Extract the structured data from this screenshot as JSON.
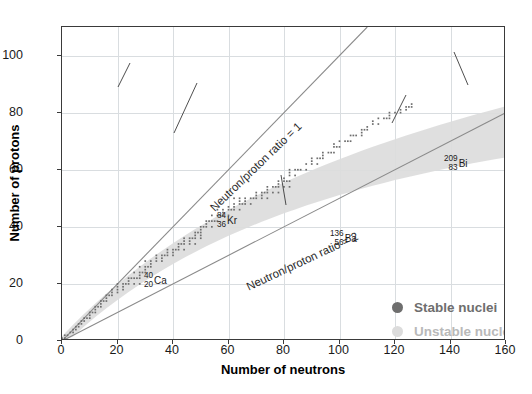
{
  "chart_data": {
    "type": "scatter",
    "title": "",
    "xlabel": "Number of neutrons",
    "ylabel": "Number of protons",
    "xlim": [
      0,
      160
    ],
    "ylim": [
      0,
      110
    ],
    "xticks": [
      0,
      20,
      40,
      60,
      80,
      100,
      120,
      140,
      160
    ],
    "yticks": [
      0,
      20,
      40,
      60,
      80,
      100
    ],
    "grid": true,
    "legend_position": "lower-right-inside",
    "series": [
      {
        "name": "Stable nuclei",
        "color": "#6e6e6e",
        "marker": "dot",
        "description": "Band of stable isotopes curving above the N/Z=1 line",
        "points": [
          [
            0,
            1
          ],
          [
            1,
            1
          ],
          [
            1,
            2
          ],
          [
            2,
            2
          ],
          [
            3,
            3
          ],
          [
            4,
            3
          ],
          [
            4,
            4
          ],
          [
            5,
            4
          ],
          [
            5,
            5
          ],
          [
            6,
            5
          ],
          [
            6,
            6
          ],
          [
            7,
            6
          ],
          [
            7,
            7
          ],
          [
            8,
            7
          ],
          [
            8,
            8
          ],
          [
            9,
            8
          ],
          [
            10,
            8
          ],
          [
            10,
            9
          ],
          [
            10,
            10
          ],
          [
            11,
            10
          ],
          [
            12,
            10
          ],
          [
            12,
            11
          ],
          [
            12,
            12
          ],
          [
            13,
            12
          ],
          [
            14,
            12
          ],
          [
            14,
            13
          ],
          [
            14,
            14
          ],
          [
            15,
            14
          ],
          [
            16,
            14
          ],
          [
            16,
            15
          ],
          [
            16,
            16
          ],
          [
            17,
            16
          ],
          [
            18,
            16
          ],
          [
            18,
            17
          ],
          [
            20,
            17
          ],
          [
            18,
            18
          ],
          [
            20,
            18
          ],
          [
            22,
            18
          ],
          [
            20,
            19
          ],
          [
            22,
            19
          ],
          [
            20,
            20
          ],
          [
            22,
            20
          ],
          [
            23,
            20
          ],
          [
            24,
            20
          ],
          [
            26,
            20
          ],
          [
            28,
            20
          ],
          [
            24,
            21
          ],
          [
            24,
            22
          ],
          [
            25,
            22
          ],
          [
            26,
            22
          ],
          [
            27,
            22
          ],
          [
            28,
            22
          ],
          [
            28,
            23
          ],
          [
            26,
            24
          ],
          [
            28,
            24
          ],
          [
            29,
            24
          ],
          [
            30,
            24
          ],
          [
            30,
            25
          ],
          [
            28,
            26
          ],
          [
            30,
            26
          ],
          [
            31,
            26
          ],
          [
            32,
            26
          ],
          [
            32,
            27
          ],
          [
            30,
            28
          ],
          [
            32,
            28
          ],
          [
            34,
            28
          ],
          [
            36,
            28
          ],
          [
            34,
            29
          ],
          [
            36,
            29
          ],
          [
            34,
            30
          ],
          [
            36,
            30
          ],
          [
            37,
            30
          ],
          [
            38,
            30
          ],
          [
            40,
            30
          ],
          [
            38,
            31
          ],
          [
            40,
            31
          ],
          [
            38,
            32
          ],
          [
            40,
            32
          ],
          [
            41,
            32
          ],
          [
            42,
            32
          ],
          [
            44,
            32
          ],
          [
            42,
            33
          ],
          [
            42,
            34
          ],
          [
            43,
            34
          ],
          [
            44,
            34
          ],
          [
            46,
            34
          ],
          [
            48,
            34
          ],
          [
            44,
            35
          ],
          [
            46,
            35
          ],
          [
            44,
            36
          ],
          [
            46,
            36
          ],
          [
            47,
            36
          ],
          [
            48,
            36
          ],
          [
            50,
            36
          ],
          [
            48,
            37
          ],
          [
            50,
            37
          ],
          [
            48,
            38
          ],
          [
            49,
            38
          ],
          [
            50,
            38
          ],
          [
            50,
            39
          ],
          [
            50,
            40
          ],
          [
            51,
            40
          ],
          [
            52,
            40
          ],
          [
            54,
            40
          ],
          [
            52,
            41
          ],
          [
            52,
            42
          ],
          [
            53,
            42
          ],
          [
            54,
            42
          ],
          [
            55,
            42
          ],
          [
            56,
            42
          ],
          [
            54,
            44
          ],
          [
            56,
            44
          ],
          [
            57,
            44
          ],
          [
            58,
            44
          ],
          [
            60,
            44
          ],
          [
            58,
            45
          ],
          [
            56,
            46
          ],
          [
            58,
            46
          ],
          [
            60,
            46
          ],
          [
            61,
            46
          ],
          [
            62,
            46
          ],
          [
            64,
            46
          ],
          [
            60,
            47
          ],
          [
            62,
            47
          ],
          [
            62,
            48
          ],
          [
            64,
            48
          ],
          [
            65,
            48
          ],
          [
            66,
            48
          ],
          [
            68,
            48
          ],
          [
            64,
            49
          ],
          [
            66,
            49
          ],
          [
            62,
            50
          ],
          [
            64,
            50
          ],
          [
            66,
            50
          ],
          [
            68,
            50
          ],
          [
            69,
            50
          ],
          [
            70,
            50
          ],
          [
            72,
            50
          ],
          [
            74,
            50
          ],
          [
            70,
            51
          ],
          [
            72,
            51
          ],
          [
            70,
            52
          ],
          [
            72,
            52
          ],
          [
            73,
            52
          ],
          [
            74,
            52
          ],
          [
            76,
            52
          ],
          [
            78,
            52
          ],
          [
            74,
            53
          ],
          [
            74,
            54
          ],
          [
            76,
            54
          ],
          [
            77,
            54
          ],
          [
            78,
            54
          ],
          [
            80,
            54
          ],
          [
            82,
            54
          ],
          [
            78,
            55
          ],
          [
            78,
            56
          ],
          [
            80,
            56
          ],
          [
            81,
            56
          ],
          [
            82,
            56
          ],
          [
            80,
            57
          ],
          [
            82,
            58
          ],
          [
            84,
            58
          ],
          [
            82,
            59
          ],
          [
            82,
            60
          ],
          [
            84,
            60
          ],
          [
            85,
            60
          ],
          [
            86,
            60
          ],
          [
            88,
            60
          ],
          [
            88,
            62
          ],
          [
            90,
            62
          ],
          [
            92,
            62
          ],
          [
            90,
            63
          ],
          [
            90,
            64
          ],
          [
            92,
            64
          ],
          [
            93,
            64
          ],
          [
            94,
            64
          ],
          [
            94,
            65
          ],
          [
            94,
            66
          ],
          [
            96,
            66
          ],
          [
            97,
            66
          ],
          [
            98,
            66
          ],
          [
            98,
            68
          ],
          [
            99,
            68
          ],
          [
            100,
            68
          ],
          [
            98,
            69
          ],
          [
            100,
            70
          ],
          [
            102,
            70
          ],
          [
            103,
            70
          ],
          [
            104,
            70
          ],
          [
            104,
            72
          ],
          [
            105,
            72
          ],
          [
            106,
            72
          ],
          [
            108,
            72
          ],
          [
            108,
            73
          ],
          [
            108,
            74
          ],
          [
            109,
            74
          ],
          [
            110,
            74
          ],
          [
            110,
            75
          ],
          [
            112,
            76
          ],
          [
            114,
            76
          ],
          [
            112,
            77
          ],
          [
            114,
            78
          ],
          [
            116,
            78
          ],
          [
            117,
            78
          ],
          [
            118,
            78
          ],
          [
            118,
            79
          ],
          [
            118,
            80
          ],
          [
            120,
            80
          ],
          [
            122,
            80
          ],
          [
            122,
            81
          ],
          [
            124,
            81
          ],
          [
            124,
            82
          ],
          [
            125,
            82
          ],
          [
            126,
            82
          ],
          [
            126,
            83
          ]
        ]
      },
      {
        "name": "Unstable nuclei",
        "color": "#dcdcdc",
        "marker": "band",
        "description": "Pale grey shaded region enveloping the stable band"
      }
    ],
    "reference_lines": [
      {
        "label": "Neutron/proton ratio = 1",
        "slope_n_over_z": 1,
        "from": [
          0,
          0
        ],
        "to": [
          110,
          110
        ],
        "color": "#808080"
      },
      {
        "label": "Neutron/proton ratio = 2",
        "slope_n_over_z": 2,
        "from": [
          0,
          0
        ],
        "to": [
          160,
          80
        ],
        "color": "#808080"
      }
    ],
    "annotations": [
      {
        "id": "ca",
        "mass": "40",
        "atomic": "20",
        "symbol": "Ca",
        "target": [
          20,
          20
        ]
      },
      {
        "id": "kr",
        "mass": "84",
        "atomic": "36",
        "symbol": "Kr",
        "target": [
          48,
          36
        ]
      },
      {
        "id": "ba",
        "mass": "136",
        "atomic": "56",
        "symbol": "Ba",
        "target": [
          80,
          56
        ]
      },
      {
        "id": "bi",
        "mass": "209",
        "atomic": "83",
        "symbol": "Bi",
        "target": [
          126,
          83
        ]
      },
      {
        "id": "u",
        "mass": "235",
        "atomic": "92",
        "symbol": "U",
        "target": [
          143,
          92
        ]
      }
    ]
  },
  "axes": {
    "x": {
      "title": "Number of neutrons",
      "ticks": [
        "0",
        "20",
        "40",
        "60",
        "80",
        "100",
        "120",
        "140",
        "160"
      ]
    },
    "y": {
      "title": "Number of protons",
      "ticks": [
        "0",
        "20",
        "40",
        "60",
        "80",
        "100"
      ]
    }
  },
  "reference_lines": {
    "ratio1": "Neutron/proton ratio = 1",
    "ratio2": "Neutron/proton ratio = 2"
  },
  "legend": {
    "items": [
      {
        "label": "Stable nuclei",
        "color": "#6e6e6e"
      },
      {
        "label": "Unstable nuclei",
        "color": "#dcdcdc"
      }
    ]
  },
  "annotations": {
    "ca": {
      "mass": "40",
      "atomic": "20",
      "symbol": "Ca"
    },
    "kr": {
      "mass": "84",
      "atomic": "36",
      "symbol": "Kr"
    },
    "ba": {
      "mass": "136",
      "atomic": "56",
      "symbol": "Ba"
    },
    "bi": {
      "mass": "209",
      "atomic": "83",
      "symbol": "Bi"
    },
    "u": {
      "mass": "235",
      "atomic": "92",
      "symbol": "U"
    }
  },
  "colors": {
    "stable": "#6e6e6e",
    "unstable": "#dcdcdc",
    "grid": "#d9dde0",
    "frame": "#3a3a3a",
    "line": "#808080"
  }
}
